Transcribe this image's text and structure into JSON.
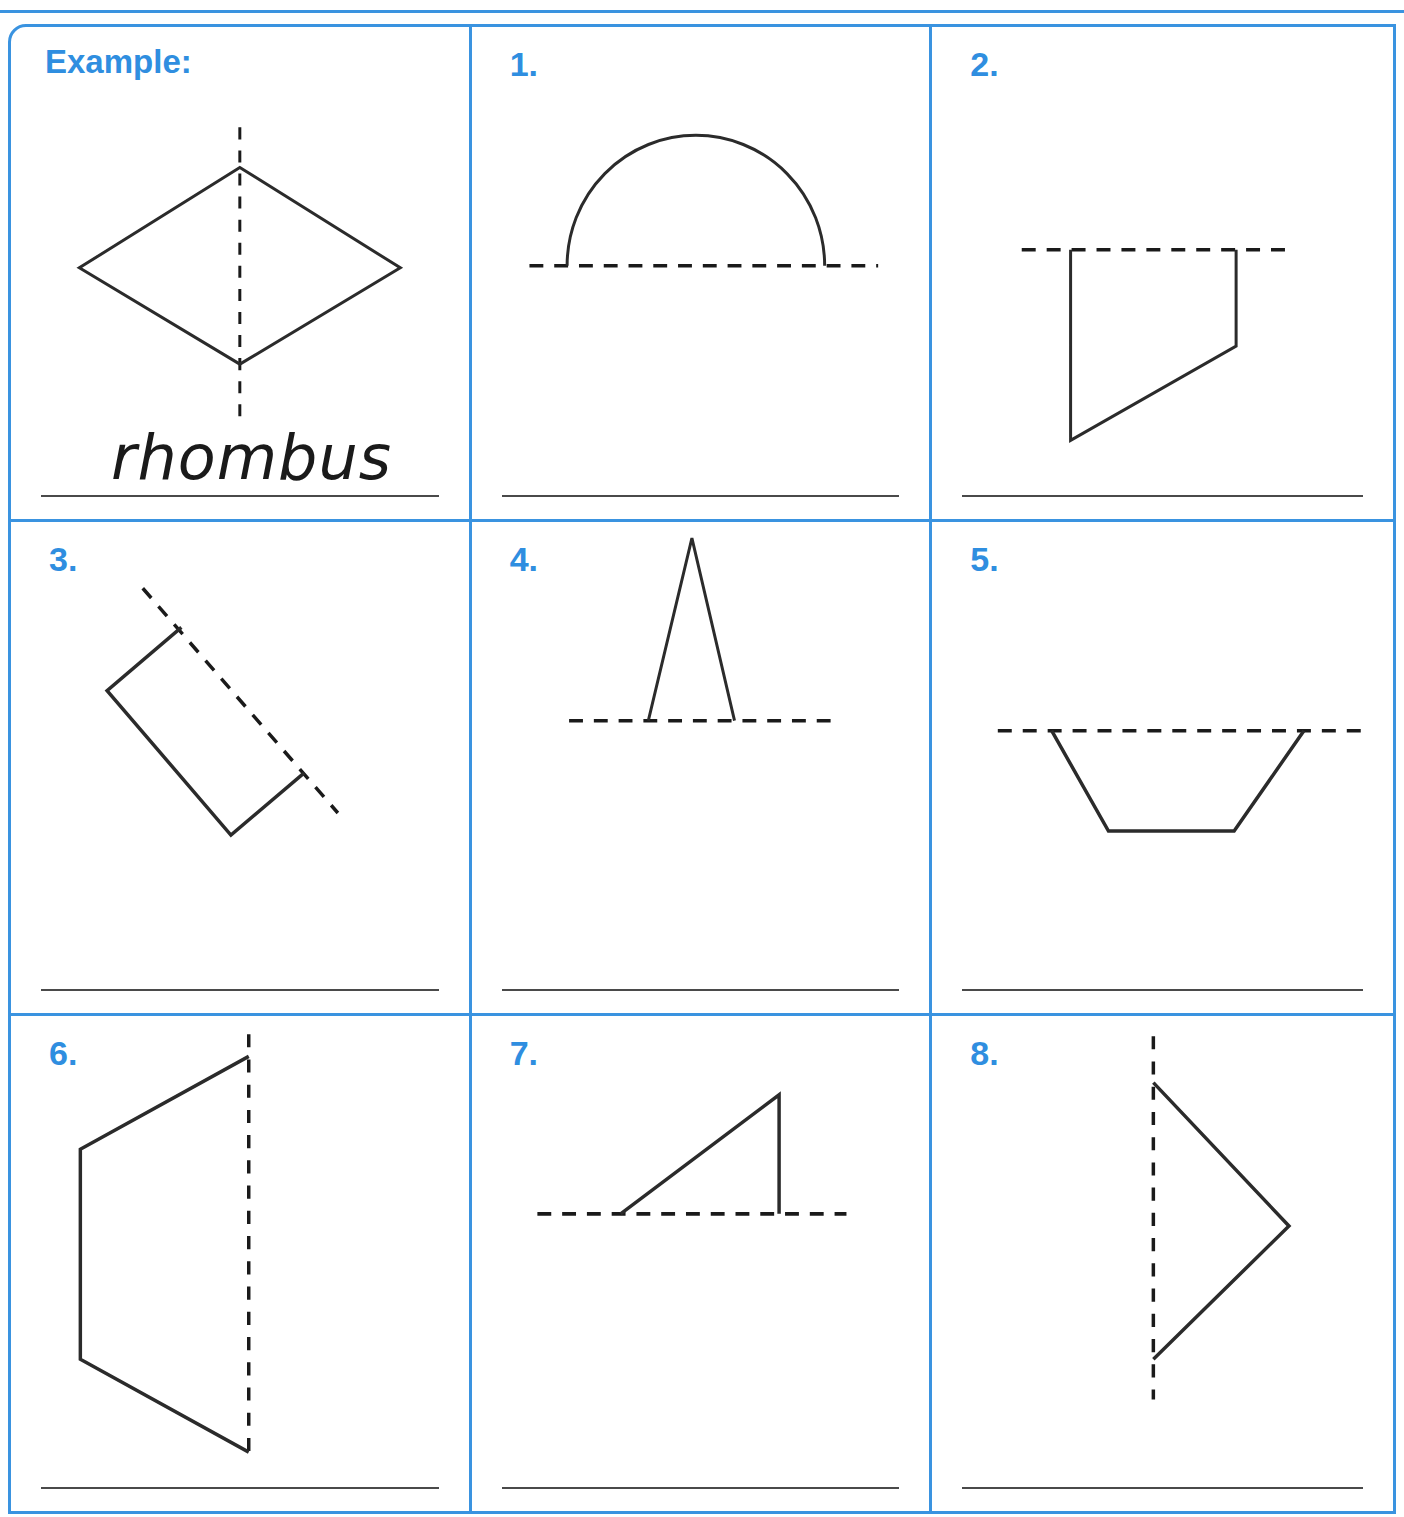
{
  "worksheet": {
    "theme_color": "#3a93e0",
    "label_color": "#2f8ee0",
    "ink_color": "#1a1a1a",
    "line_color": "#4a4a4a"
  },
  "cells": [
    {
      "number": "Example:",
      "answer": "rhombus",
      "shape_name": "rhombus-half-with-vertical-line-of-symmetry",
      "symmetry_line": "vertical-dashed"
    },
    {
      "number": "1.",
      "answer": "",
      "shape_name": "semicircle-above-horizontal-line-of-symmetry",
      "symmetry_line": "horizontal-dashed"
    },
    {
      "number": "2.",
      "answer": "",
      "shape_name": "right-trapezoid-below-horizontal-line-of-symmetry",
      "symmetry_line": "horizontal-dashed"
    },
    {
      "number": "3.",
      "answer": "",
      "shape_name": "tilted-rectangle-half-with-diagonal-line-of-symmetry",
      "symmetry_line": "diagonal-dashed"
    },
    {
      "number": "4.",
      "answer": "",
      "shape_name": "narrow-triangle-above-horizontal-line-of-symmetry",
      "symmetry_line": "horizontal-dashed"
    },
    {
      "number": "5.",
      "answer": "",
      "shape_name": "trapezoid-below-horizontal-line-of-symmetry",
      "symmetry_line": "horizontal-dashed"
    },
    {
      "number": "6.",
      "answer": "",
      "shape_name": "half-hexagon-left-of-vertical-line-of-symmetry",
      "symmetry_line": "vertical-dashed"
    },
    {
      "number": "7.",
      "answer": "",
      "shape_name": "right-triangle-above-horizontal-line-of-symmetry",
      "symmetry_line": "horizontal-dashed"
    },
    {
      "number": "8.",
      "answer": "",
      "shape_name": "triangle-right-of-vertical-line-of-symmetry",
      "symmetry_line": "vertical-dashed"
    }
  ]
}
